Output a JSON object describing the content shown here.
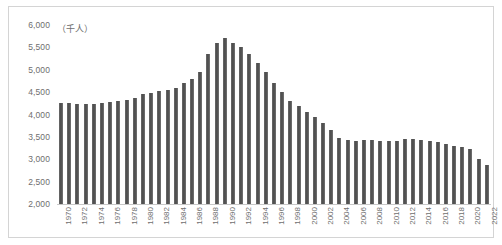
{
  "chart": {
    "unit_label": "（千人）",
    "border_color": "#d4d4d4",
    "bar_color": "#595959",
    "axis_color": "#c8c8c8",
    "tick_text_color": "#6e6e6e"
  },
  "chart_data": {
    "type": "bar",
    "title": "",
    "subtitle": "",
    "xlabel": "",
    "ylabel": "（千人）",
    "ylim": [
      2000,
      6000
    ],
    "ytick_step": 500,
    "ytick_labels": [
      "6,000",
      "5,500",
      "5,000",
      "4,500",
      "4,000",
      "3,500",
      "3,000",
      "2,500",
      "2,000"
    ],
    "ytick_values": [
      6000,
      5500,
      5000,
      4500,
      4000,
      3500,
      3000,
      2500,
      2000
    ],
    "grid": false,
    "legend": "none",
    "xtick_label_rotation": -90,
    "xtick_label_interval": 2,
    "xtick_labels": [
      "1970",
      "1972",
      "1974",
      "1976",
      "1978",
      "1980",
      "1982",
      "1984",
      "1986",
      "1988",
      "1990",
      "1992",
      "1994",
      "1996",
      "1998",
      "2000",
      "2002",
      "2004",
      "2006",
      "2008",
      "2010",
      "2012",
      "2014",
      "2016",
      "2018",
      "2020",
      "2022"
    ],
    "categories": [
      "1970",
      "1971",
      "1972",
      "1973",
      "1974",
      "1975",
      "1976",
      "1977",
      "1978",
      "1979",
      "1980",
      "1981",
      "1982",
      "1983",
      "1984",
      "1985",
      "1986",
      "1987",
      "1988",
      "1989",
      "1990",
      "1991",
      "1992",
      "1993",
      "1994",
      "1995",
      "1996",
      "1997",
      "1998",
      "1999",
      "2000",
      "2001",
      "2002",
      "2003",
      "2004",
      "2005",
      "2006",
      "2007",
      "2008",
      "2009",
      "2010",
      "2011",
      "2012",
      "2013",
      "2014",
      "2015",
      "2016",
      "2017",
      "2018",
      "2019",
      "2020",
      "2021",
      "2022"
    ],
    "values": [
      4250,
      4250,
      4240,
      4230,
      4240,
      4250,
      4270,
      4300,
      4330,
      4380,
      4450,
      4470,
      4520,
      4540,
      4600,
      4700,
      4800,
      4950,
      5350,
      5600,
      5700,
      5600,
      5500,
      5350,
      5150,
      4950,
      4700,
      4500,
      4300,
      4180,
      4050,
      3950,
      3800,
      3650,
      3480,
      3430,
      3400,
      3420,
      3420,
      3400,
      3400,
      3400,
      3450,
      3450,
      3430,
      3410,
      3380,
      3350,
      3300,
      3270,
      3220,
      3000,
      2880
    ]
  }
}
